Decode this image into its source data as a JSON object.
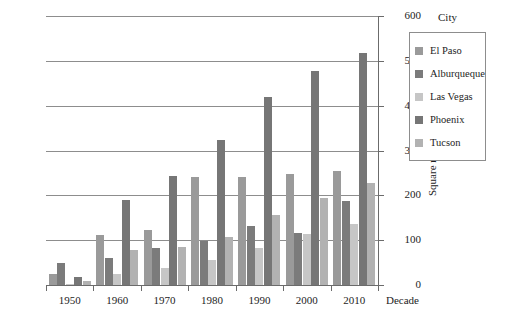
{
  "chart_data": {
    "type": "bar",
    "title": "",
    "xlabel": "Decade",
    "ylabel": "Square miles",
    "legend_title": "City",
    "legend_position": "right",
    "grid": true,
    "ylim": [
      0,
      600
    ],
    "yticks": [
      0,
      100,
      200,
      300,
      400,
      500,
      600
    ],
    "categories": [
      "1950",
      "1960",
      "1970",
      "1980",
      "1990",
      "2000",
      "2010"
    ],
    "series": [
      {
        "name": "El Paso",
        "color": "#9a9a9a",
        "values": [
          25,
          112,
          122,
          240,
          240,
          247,
          255
        ]
      },
      {
        "name": "Alburqueque",
        "color": "#7b7b7b",
        "values": [
          48,
          61,
          83,
          98,
          132,
          117,
          188
        ]
      },
      {
        "name": "Las Vegas",
        "color": "#c6c6c6",
        "values": [
          3,
          25,
          37,
          55,
          83,
          113,
          135
        ]
      },
      {
        "name": "Phoenix",
        "color": "#767676",
        "values": [
          17,
          190,
          243,
          324,
          419,
          478,
          517
        ]
      },
      {
        "name": "Tucson",
        "color": "#b2b2b2",
        "values": [
          10,
          78,
          85,
          108,
          156,
          195,
          227
        ]
      }
    ]
  }
}
